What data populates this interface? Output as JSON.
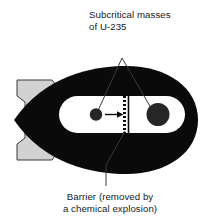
{
  "diagram": {
    "colors": {
      "body": "#0a0a0a",
      "fin": "#d2d2d2",
      "fin_outline": "#3a3a3a",
      "chamber": "#ffffff",
      "mass": "#262626",
      "text": "#1a1a1a",
      "leader": "#3a3a3a",
      "background": "#ffffff"
    },
    "annotations": {
      "top": {
        "name": "subcritical-masses-label",
        "lines": [
          "Subcritical masses",
          "of U-235"
        ]
      },
      "bottom": {
        "name": "barrier-label",
        "lines": [
          "Barrier (removed by",
          "a chemical explosion)"
        ]
      }
    },
    "parts": {
      "bomb_body": "bomb-casing",
      "tail_fin": "tail-fin-assembly",
      "chamber": "interior-chamber",
      "small_mass": "small-subcritical-mass",
      "large_mass": "large-subcritical-mass",
      "arrow": "projectile-direction-arrow",
      "barrier": "barrier-divider"
    }
  }
}
